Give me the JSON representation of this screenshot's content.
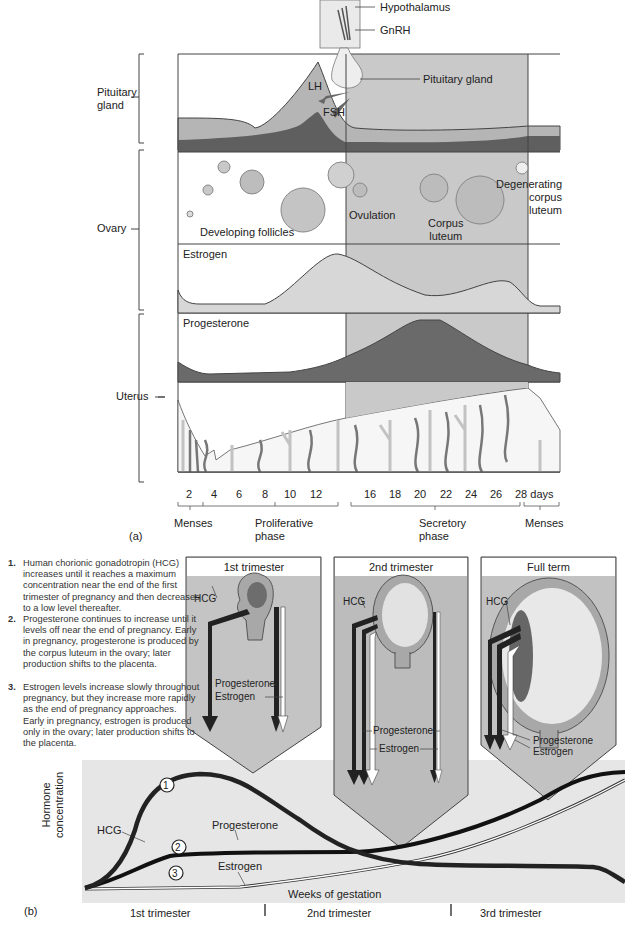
{
  "panel_a": {
    "label": "(a)",
    "top_labels": {
      "hypothalamus": "Hypothalamus",
      "gnrh": "GnRH",
      "pituitary_gland": "Pituitary gland",
      "lh": "LH",
      "fsh": "FSH"
    },
    "row_labels": {
      "pituitary": [
        "Pituitary",
        "gland"
      ],
      "ovary": "Ovary",
      "uterus": "Uterus"
    },
    "ovary_labels": {
      "developing_follicles": "Developing follicles",
      "ovulation": "Ovulation",
      "corpus_luteum": [
        "Corpus",
        "luteum"
      ],
      "degenerating": [
        "Degenerating",
        "corpus",
        "luteum"
      ]
    },
    "hormone_labels": {
      "estrogen": "Estrogen",
      "progesterone": "Progesterone"
    },
    "day_ticks": [
      "2",
      "4",
      "6",
      "8",
      "10",
      "12",
      "16",
      "18",
      "20",
      "22",
      "24",
      "26",
      "28 days"
    ],
    "phases": [
      {
        "label": [
          "Menses"
        ]
      },
      {
        "label": [
          "Proliferative",
          "phase"
        ]
      },
      {
        "label": [
          "Secretory",
          "phase"
        ]
      },
      {
        "label": [
          "Menses"
        ]
      }
    ]
  },
  "panel_b": {
    "label": "(b)",
    "notes": [
      {
        "num": "1.",
        "text": "Human chorionic gonadotropin (HCG) increases until it reaches a maximum concentration near the end of the first trimester of pregnancy and then decreases to a low level thereafter."
      },
      {
        "num": "2.",
        "text": "Progesterone continues to increase until it levels off near the end of pregnancy. Early in pregnancy, progesterone is produced by the corpus luteum in the ovary; later production shifts to the placenta."
      },
      {
        "num": "3.",
        "text": "Estrogen levels increase slowly throughout pregnancy, but they increase more rapidly as the end of pregnancy approaches. Early in pregnancy, estrogen is produced only in the ovary; later production shifts to the placenta."
      }
    ],
    "stage_boxes": [
      {
        "title": "1st trimester",
        "hcg": "HCG",
        "progesterone": "Progesterone",
        "estrogen": "Estrogen"
      },
      {
        "title": "2nd trimester",
        "hcg": "HCG",
        "progesterone": "Progesterone",
        "estrogen": "Estrogen"
      },
      {
        "title": "Full term",
        "hcg": "HCG",
        "progesterone": "Progesterone",
        "estrogen": "Estrogen"
      }
    ],
    "y_axis": [
      "Hormone",
      "concentration"
    ],
    "x_axis": "Weeks of gestation",
    "curve_labels": {
      "hcg": "HCG",
      "progesterone": "Progesterone",
      "estrogen": "Estrogen"
    },
    "circle_numbers": [
      "1",
      "2",
      "3"
    ],
    "trimesters": [
      "1st trimester",
      "2nd trimester",
      "3rd trimester"
    ]
  },
  "colors": {
    "shade_light": "#d4d4d4",
    "shade_mid": "#b8b8b8",
    "shade_dark": "#6e6e6e",
    "line": "#444444",
    "curve": "#1a1a1a"
  }
}
